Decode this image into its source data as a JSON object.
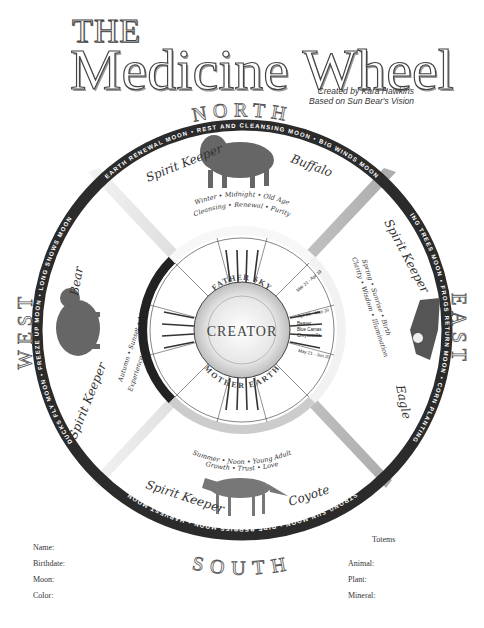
{
  "header": {
    "title_small": "THE",
    "title_main": "Medicine Wheel",
    "credit_line1": "Created by Kara Hawkins",
    "credit_line2": "Based on Sun Bear's Vision"
  },
  "directions": {
    "north": "NORTH",
    "east": "EAST",
    "south": "SOUTH",
    "west": "WEST"
  },
  "moons": {
    "north": [
      "EARTH RENEWAL MOON",
      "REST AND CLEANSING MOON",
      "BIG WINDS MOON"
    ],
    "east": [
      "BUDDING TREES MOON",
      "FROGS RETURN MOON",
      "CORN PLANTING MOON"
    ],
    "south": [
      "STRONG SUN MOON",
      "RIPE BERRIES MOON",
      "HARVEST MOON"
    ],
    "west": [
      "DUCKS FLY MOON",
      "FREEZE UP MOON",
      "LONG SNOWS MOON"
    ]
  },
  "quadrants": {
    "north": {
      "spirit_keeper_label": "Spirit Keeper",
      "animal": "Buffalo",
      "line1": "Winter • Midnight • Old Age",
      "line2": "Cleansing • Renewal • Purity"
    },
    "east": {
      "spirit_keeper_label": "Spirit Keeper",
      "animal": "Eagle",
      "line1": "Spring • Sunrise • Birth",
      "line2": "Clarity • Wisdom • Illumination"
    },
    "south": {
      "spirit_keeper_label": "Spirit Keeper",
      "animal": "Coyote",
      "line1": "Summer • Noon • Young Adult",
      "line2": "Growth • Trust • Love"
    },
    "west": {
      "spirit_keeper_label": "Spirit Keeper",
      "animal": "Bear",
      "line1": "Autumn • Sunset • Maturity",
      "line2": "Experience • Introspection • Strength"
    }
  },
  "center": {
    "creator": "CREATOR",
    "father_sky": "FATHER SKY",
    "mother_earth": "MOTHER EARTH"
  },
  "inner_dates": [
    "Mar 21 - Apr 19",
    "Apr 20 - May 20",
    "May 21 - Jun 20",
    "Jun 21 - Jul 22",
    "Jul 23 - Aug 22",
    "Aug 23 - Sep 22",
    "Sep 23 - Oct 22",
    "Oct 23 - Nov 21",
    "Nov 22 - Dec 21",
    "Dec 22 - Jan 19",
    "Jan 20 - Feb 18",
    "Feb 19 - Mar 20"
  ],
  "inner_totems_visible": [
    "Beaver",
    "Blue Camas",
    "Chrysocolla",
    "Serpentine",
    "Snow Goose",
    "Elk",
    "Otter"
  ],
  "form": {
    "totems_heading": "Totems",
    "left_fields": [
      "Name:",
      "Birthdate:",
      "Moon:",
      "Color:"
    ],
    "right_fields": [
      "Animal:",
      "Plant:",
      "Mineral:"
    ]
  }
}
